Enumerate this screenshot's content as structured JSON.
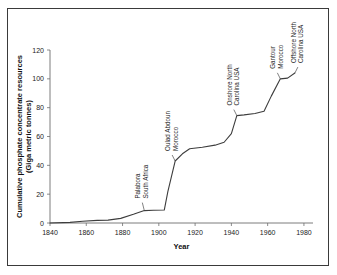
{
  "chart_data": {
    "type": "line",
    "title": "",
    "xlabel": "Year",
    "ylabel": "Cumulative phosphate concentrate resources (Giga metric tonnes)",
    "ylabel_line1": "Cumulative phosphate concentrate resources",
    "ylabel_line2": "(Giga metric tonnes)",
    "xlim": [
      1840,
      1985
    ],
    "ylim": [
      0,
      120
    ],
    "grid": false,
    "legend": false,
    "xticks": [
      1840,
      1860,
      1880,
      1900,
      1920,
      1940,
      1960,
      1980
    ],
    "yticks": [
      0,
      20,
      40,
      60,
      80,
      100,
      120
    ],
    "xtick_labels": [
      "1840",
      "1860",
      "1880",
      "1900",
      "1920",
      "1940",
      "1960",
      "1980"
    ],
    "ytick_labels": [
      "0",
      "20",
      "40",
      "60",
      "80",
      "100",
      "120"
    ],
    "series": [
      {
        "name": "Cumulative phosphate concentrate resources",
        "x": [
          1840,
          1851,
          1858,
          1866,
          1872,
          1879,
          1886,
          1892,
          1897,
          1903,
          1905,
          1909,
          1913,
          1917,
          1924,
          1931,
          1936,
          1940,
          1943,
          1947,
          1953,
          1958,
          1962,
          1967,
          1971,
          1975
        ],
        "y": [
          0,
          0.4,
          1.2,
          1.8,
          2.0,
          3.2,
          6.0,
          8.6,
          8.8,
          9.0,
          22.0,
          43.0,
          48.0,
          51.5,
          52.5,
          54.0,
          56.0,
          62.0,
          74.5,
          75.0,
          76.0,
          77.5,
          88.0,
          100.0,
          100.5,
          104.0
        ]
      }
    ],
    "annotations": [
      {
        "id": "palabora-south-africa",
        "line1": "Palabora",
        "line2": "South Africa",
        "x": 1892,
        "y": 8.6
      },
      {
        "id": "oulad-abdoun-morocco",
        "line1": "Oulad Abdoun",
        "line2": "Morocco",
        "x": 1909,
        "y": 43.0
      },
      {
        "id": "onshore-north-carolina-usa",
        "line1": "Onshore North",
        "line2": "Carolina USA",
        "x": 1943,
        "y": 74.5
      },
      {
        "id": "gantour-morocco",
        "line1": "Gantour",
        "line2": "Morocco",
        "x": 1967,
        "y": 100.0
      },
      {
        "id": "offshore-north-carolina-usa",
        "line1": "Offshore North",
        "line2": "Carolina USA",
        "x": 1975,
        "y": 104.0
      }
    ],
    "colors": {
      "line": "#3d3d3d",
      "axis": "#6e6e6e",
      "text": "#1a1a1a",
      "frame": "#3a3a3a",
      "background": "#ffffff"
    }
  }
}
